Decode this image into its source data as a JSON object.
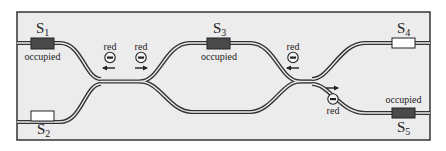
{
  "colors": {
    "background": "#ececec",
    "frame": "#333333",
    "track": "#333333",
    "track_gap": "#ececec",
    "occupied": "#4a4a4a",
    "free": "#ffffff"
  },
  "slots": [
    {
      "id": "S1",
      "name": "S",
      "sub": "1",
      "status": "occupied",
      "status_label": "occupied"
    },
    {
      "id": "S2",
      "name": "S",
      "sub": "2",
      "status": "free",
      "status_label": ""
    },
    {
      "id": "S3",
      "name": "S",
      "sub": "3",
      "status": "occupied",
      "status_label": "occupied"
    },
    {
      "id": "S4",
      "name": "S",
      "sub": "4",
      "status": "free",
      "status_label": ""
    },
    {
      "id": "S5",
      "name": "S",
      "sub": "5",
      "status": "occupied",
      "status_label": "occupied"
    }
  ],
  "particles": [
    {
      "label": "red",
      "charge": "negative",
      "direction": "left"
    },
    {
      "label": "red",
      "charge": "negative",
      "direction": "right"
    },
    {
      "label": "red",
      "charge": "negative",
      "direction": "left"
    },
    {
      "label": "red",
      "charge": "negative",
      "direction": "right"
    }
  ]
}
